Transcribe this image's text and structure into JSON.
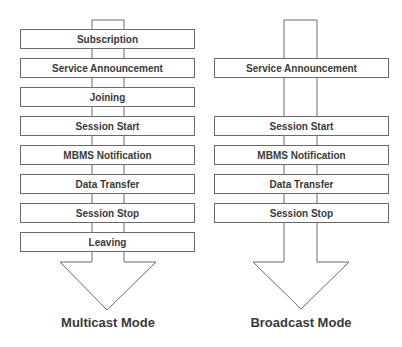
{
  "diagram": {
    "type": "flow-comparison",
    "multicast": {
      "label": "Multicast Mode",
      "steps": [
        "Subscription",
        "Service Announcement",
        "Joining",
        "Session Start",
        "MBMS Notification",
        "Data Transfer",
        "Session Stop",
        "Leaving"
      ]
    },
    "broadcast": {
      "label": "Broadcast Mode",
      "steps": [
        "Service Announcement",
        "Session Start",
        "MBMS Notification",
        "Data Transfer",
        "Session Stop"
      ]
    },
    "colors": {
      "stroke": "#6a6a6a",
      "text": "#3a3a3a",
      "background": "#ffffff"
    }
  }
}
